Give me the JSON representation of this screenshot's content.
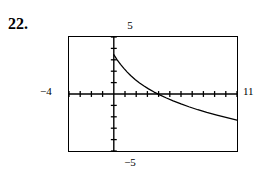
{
  "problem": {
    "number": "22."
  },
  "window_labels": {
    "ymax": "5",
    "ymin": "−5",
    "xmin": "−4",
    "xmax": "11"
  },
  "colors": {
    "frame": "#000000",
    "axis": "#000000",
    "curve": "#000000",
    "background": "#ffffff"
  },
  "chart_data": {
    "type": "line",
    "title": "",
    "xlabel": "",
    "ylabel": "",
    "xlim": [
      -4,
      11
    ],
    "ylim": [
      -5,
      5
    ],
    "grid": false,
    "legend": null,
    "axis_ticks": {
      "x_tick_spacing": 1,
      "y_tick_spacing": 1,
      "x_ticks": [
        -4,
        -3,
        -2,
        -1,
        0,
        1,
        2,
        3,
        4,
        5,
        6,
        7,
        8,
        9,
        10,
        11
      ],
      "y_ticks": [
        -5,
        -4,
        -3,
        -2,
        -1,
        0,
        1,
        2,
        3,
        4,
        5
      ]
    },
    "series": [
      {
        "name": "curve",
        "x": [
          0.0,
          0.3,
          0.6,
          0.9,
          1.2,
          1.5,
          1.9,
          2.3,
          2.7,
          3.1,
          3.6,
          4.1,
          4.7,
          5.3,
          6.0,
          6.7,
          7.5,
          8.3,
          9.2,
          10.1,
          11.0
        ],
        "y": [
          3.45,
          3.0,
          2.6,
          2.25,
          1.92,
          1.62,
          1.28,
          0.97,
          0.7,
          0.45,
          0.17,
          -0.08,
          -0.35,
          -0.6,
          -0.87,
          -1.12,
          -1.38,
          -1.62,
          -1.86,
          -2.08,
          -2.3
        ]
      }
    ],
    "annotations": [
      {
        "text": "x-intercept near x = 3.5",
        "x": 3.5,
        "y": 0
      }
    ]
  }
}
